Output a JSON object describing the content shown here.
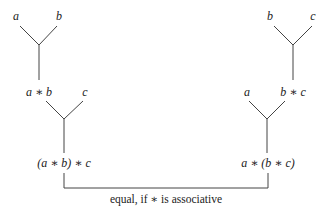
{
  "left_tree": {
    "leaf_a": "a",
    "leaf_b": "b",
    "node_ab": "a ∗ b",
    "leaf_c": "c",
    "root": "(a ∗ b) ∗ c"
  },
  "right_tree": {
    "leaf_b": "b",
    "leaf_c": "c",
    "leaf_a": "a",
    "node_bc": "b ∗ c",
    "root": "a ∗ (b ∗ c)"
  },
  "caption": "equal, if ∗ is associative",
  "colors": {
    "line": "#444444",
    "text": "#222222",
    "background": "#ffffff"
  }
}
